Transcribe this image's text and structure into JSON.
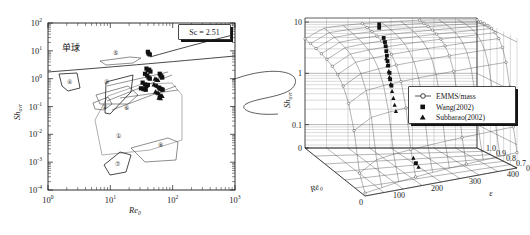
{
  "figure": {
    "title": "",
    "connector_label": "connector-curve"
  },
  "chart_data": [
    {
      "id": "left-panel",
      "type": "scatter",
      "title": "",
      "xlabel": "Re",
      "xlabel_sub": "0",
      "ylabel": "Sh",
      "ylabel_sub": "ovr",
      "xscale": "log",
      "yscale": "log",
      "xlim": [
        1,
        1000
      ],
      "ylim": [
        0.0001,
        100
      ],
      "xticks": [
        "10",
        "10",
        "10",
        "10"
      ],
      "xtick_exps": [
        "0",
        "1",
        "2",
        "3"
      ],
      "yticks": [
        "10",
        "10",
        "10",
        "10",
        "10",
        "10",
        "10"
      ],
      "ytick_exps": [
        "2",
        "1",
        "0",
        "-1",
        "-2",
        "-3",
        "-4"
      ],
      "grid": false,
      "annotations": [
        {
          "name": "single-sphere-label",
          "text": "单球",
          "x": 2.6,
          "y": 13
        },
        {
          "name": "sc-value-label",
          "text": "Sc = 2.51",
          "x": 300,
          "y": 40
        }
      ],
      "region_labels": [
        "①",
        "②",
        "③",
        "④",
        "⑤",
        "⑥",
        "⑦",
        "⑧"
      ],
      "series": [
        {
          "name": "Wang(2002)",
          "marker": "square",
          "points": [
            [
              40,
              9.2
            ],
            [
              41,
              8.0
            ],
            [
              43,
              7.4
            ],
            [
              38,
              2.3
            ],
            [
              40,
              2.0
            ],
            [
              42,
              2.1
            ],
            [
              44,
              1.8
            ],
            [
              36,
              1.5
            ],
            [
              39,
              1.3
            ],
            [
              41,
              1.1
            ],
            [
              43,
              1.0
            ],
            [
              33,
              0.72
            ],
            [
              36,
              0.62
            ],
            [
              38,
              0.55
            ],
            [
              40,
              0.6
            ],
            [
              31,
              0.45
            ],
            [
              34,
              0.42
            ],
            [
              37,
              0.4
            ],
            [
              62,
              1.5
            ],
            [
              64,
              1.3
            ],
            [
              66,
              1.2
            ],
            [
              68,
              1.1
            ],
            [
              60,
              0.48
            ],
            [
              63,
              0.44
            ],
            [
              66,
              0.42
            ],
            [
              69,
              0.4
            ]
          ]
        },
        {
          "name": "Subbarao(2002)",
          "marker": "triangle",
          "points": [
            [
              52,
              1.0
            ],
            [
              55,
              0.95
            ],
            [
              58,
              0.9
            ],
            [
              50,
              0.62
            ],
            [
              54,
              0.58
            ],
            [
              57,
              0.55
            ],
            [
              53,
              0.34
            ],
            [
              56,
              0.32
            ],
            [
              59,
              0.3
            ],
            [
              62,
              0.26
            ],
            [
              65,
              0.25
            ],
            [
              68,
              0.24
            ],
            [
              60,
              0.21
            ],
            [
              64,
              0.2
            ]
          ]
        }
      ]
    },
    {
      "id": "right-panel",
      "type": "line",
      "projection": "3d-surface",
      "title": "",
      "xlabel": "Re",
      "xlabel_sub": "0",
      "ylabel": "Sh",
      "ylabel_sub": "ovr",
      "zlabel": "ε",
      "zscale": "log",
      "xticks": [
        "0",
        "100",
        "200",
        "300",
        "400"
      ],
      "zticks": [
        "0.6",
        "0.7",
        "0.8",
        "0.9",
        "1.0"
      ],
      "yticks": [
        "0",
        "0.1",
        "1",
        "10"
      ],
      "ylim": [
        0.03,
        12
      ],
      "xlim": [
        0,
        400
      ],
      "zlim": [
        0.55,
        1.02
      ],
      "grid": true,
      "legend_position": "center-right",
      "legend": [
        {
          "label": "EMMS/mass",
          "marker": "circle-line"
        },
        {
          "label": "Wang(2002)",
          "marker": "square"
        },
        {
          "label": "Subbarao(2002)",
          "marker": "triangle"
        }
      ]
    }
  ]
}
